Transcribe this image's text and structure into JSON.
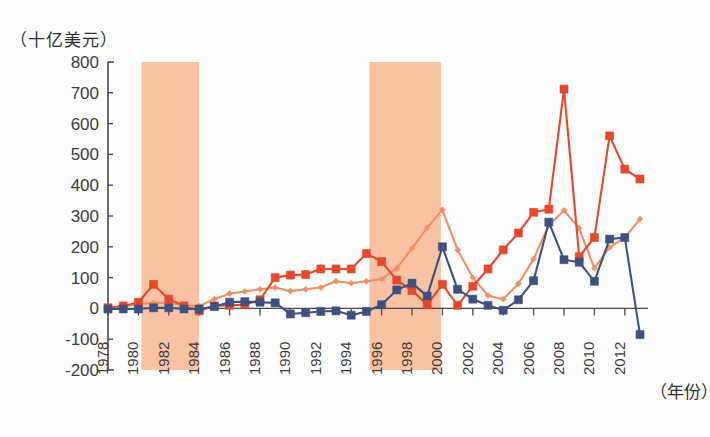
{
  "chart_data": {
    "type": "line",
    "title": "",
    "subtitle": "",
    "ylabel": "（十亿美元）",
    "xlabel": "（年份）",
    "ylim": [
      -200,
      800
    ],
    "ytick_step": 100,
    "yticks": [
      "800",
      "700",
      "600",
      "500",
      "400",
      "300",
      "200",
      "100",
      "0",
      "-100",
      "-200"
    ],
    "grid": false,
    "legend": "none",
    "xlim": [
      1978,
      2013
    ],
    "x": [
      1978,
      1979,
      1980,
      1981,
      1982,
      1983,
      1984,
      1985,
      1986,
      1987,
      1988,
      1989,
      1990,
      1991,
      1992,
      1993,
      1994,
      1995,
      1996,
      1997,
      1998,
      1999,
      2000,
      2001,
      2002,
      2003,
      2004,
      2005,
      2006,
      2007,
      2008,
      2009,
      2010,
      2011,
      2012,
      2013
    ],
    "xticks": [
      "1978",
      "1980",
      "1982",
      "1984",
      "1986",
      "1988",
      "1990",
      "1992",
      "1994",
      "1996",
      "1998",
      "2000",
      "2002",
      "2004",
      "2006",
      "2008",
      "2010",
      "2012"
    ],
    "xtick_years": [
      1978,
      1980,
      1982,
      1984,
      1986,
      1988,
      1990,
      1992,
      1994,
      1996,
      1998,
      2000,
      2002,
      2004,
      2006,
      2008,
      2010,
      2012
    ],
    "shaded_bands": [
      {
        "start": 1980.2,
        "end": 1984.0,
        "color": "#f9c3a3"
      },
      {
        "start": 1995.2,
        "end": 1999.9,
        "color": "#f9c3a3"
      }
    ],
    "series": [
      {
        "name": "series-red",
        "color": "#e8472a",
        "marker": "square",
        "values": [
          2,
          8,
          20,
          78,
          30,
          8,
          -8,
          8,
          10,
          12,
          28,
          100,
          108,
          110,
          128,
          128,
          128,
          178,
          152,
          92,
          58,
          12,
          78,
          10,
          72,
          128,
          190,
          245,
          312,
          322,
          712,
          168,
          230,
          560,
          452,
          420
        ]
      },
      {
        "name": "series-light-orange",
        "color": "#f28e62",
        "marker": "diamond",
        "values": [
          3,
          6,
          14,
          18,
          18,
          10,
          8,
          30,
          48,
          55,
          62,
          68,
          56,
          62,
          68,
          88,
          82,
          88,
          95,
          130,
          195,
          262,
          320,
          190,
          100,
          42,
          30,
          80,
          160,
          270,
          318,
          260,
          130,
          198,
          230,
          290
        ]
      },
      {
        "name": "series-blue",
        "color": "#3e4f80",
        "marker": "square",
        "values": [
          -2,
          -2,
          -2,
          2,
          2,
          -2,
          -2,
          6,
          20,
          22,
          20,
          18,
          -18,
          -14,
          -10,
          -8,
          -22,
          -10,
          12,
          60,
          82,
          40,
          200,
          62,
          30,
          10,
          -6,
          28,
          90,
          280,
          158,
          150,
          88,
          225,
          230,
          -85
        ]
      }
    ]
  }
}
